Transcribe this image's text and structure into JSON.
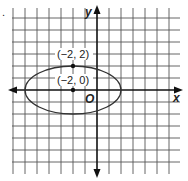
{
  "figure": {
    "bullet": ".",
    "axes": {
      "x_label": "x",
      "y_label": "y",
      "origin_label": "O"
    },
    "grid": {
      "cols": 14,
      "rows": 13,
      "unit_px": 12
    },
    "ellipse": {
      "center": [
        -2,
        0
      ],
      "semi_x": 4,
      "semi_y": 2
    },
    "points": [
      {
        "label": "(−2, 2)",
        "coords": [
          -2,
          2
        ]
      },
      {
        "label": "(−2, 0)",
        "coords": [
          -2,
          0
        ]
      }
    ],
    "colors": {
      "grid": "#444444",
      "axis": "#111111",
      "curve": "#333333"
    }
  }
}
